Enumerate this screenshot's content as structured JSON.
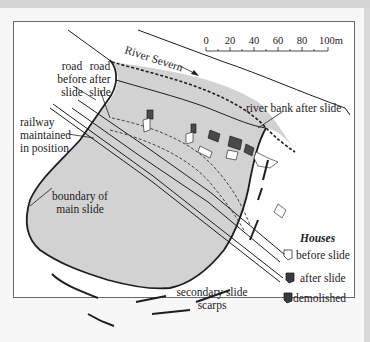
{
  "figure": {
    "type": "landslide map",
    "river_label": "River Severn",
    "scale_bar": {
      "ticks": [
        "0",
        "20",
        "40",
        "60",
        "80",
        "100m"
      ],
      "unit": "m"
    },
    "labels": {
      "road_before_1": "road",
      "road_before_2": "before",
      "road_before_3": "slide",
      "road_after_1": "road",
      "road_after_2": "after",
      "road_after_3": "slide",
      "railway_1": "railway",
      "railway_2": "maintained",
      "railway_3": "in position",
      "boundary_1": "boundary of",
      "boundary_2": "main slide",
      "river_bank": "river bank after slide",
      "scarps_1": "secondary slide",
      "scarps_2": "scarps"
    },
    "legend": {
      "title": "Houses",
      "items": [
        {
          "label": "before slide",
          "symbol": "outline-house"
        },
        {
          "label": "after slide",
          "symbol": "dark-house"
        },
        {
          "label": "demolished",
          "symbol": "crossed-dark-house"
        }
      ]
    },
    "colors": {
      "slide_fill": "#d2d2d2",
      "line": "#1e1e1e",
      "house_dark": "#4a4a4a"
    }
  }
}
